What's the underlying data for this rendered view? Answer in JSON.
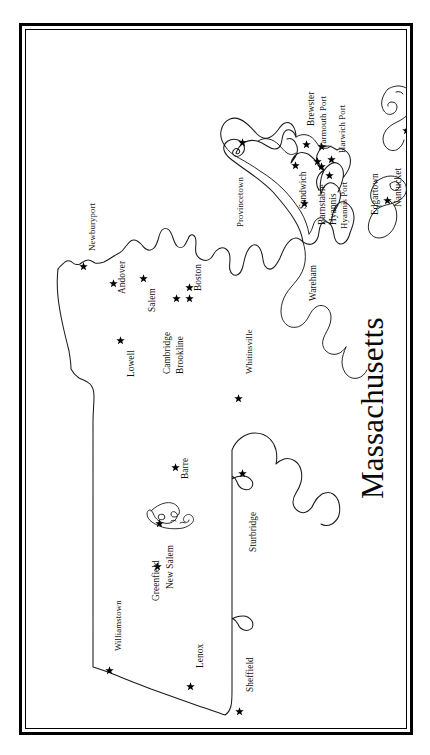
{
  "title": "Massachusetts",
  "frame": {
    "style": "double-line-border",
    "outer_color": "#000000",
    "inner_color": "#000000"
  },
  "map": {
    "orientation": "rotated-90-ccw",
    "state": "Massachusetts",
    "outline_color": "#1a1a1a",
    "background": "#ffffff",
    "marker_symbol": "star",
    "marker_color": "#000000",
    "features": [
      "mainland",
      "cape-cod",
      "marthas-vineyard",
      "nantucket",
      "quabbin-reservoir"
    ]
  },
  "cities": [
    {
      "name": "Newburyport",
      "label_x": 62,
      "label_y": 222,
      "star_x": 54,
      "star_y": 233
    },
    {
      "name": "Andover",
      "label_x": 92,
      "label_y": 265,
      "star_x": 84,
      "star_y": 250
    },
    {
      "name": "Salem",
      "label_x": 122,
      "label_y": 283,
      "star_x": 114,
      "star_y": 245
    },
    {
      "name": "Lowell",
      "label_x": 101,
      "label_y": 348,
      "star_x": 91,
      "star_y": 307
    },
    {
      "name": "Boston",
      "label_x": 168,
      "label_y": 262,
      "star_x": 160,
      "star_y": 254
    },
    {
      "name": "Cambridge",
      "label_x": 137,
      "label_y": 345,
      "star_x": 147,
      "star_y": 265
    },
    {
      "name": "Brookline",
      "label_x": 150,
      "label_y": 345,
      "star_x": 160,
      "star_y": 265
    },
    {
      "name": "Whitinsville",
      "label_x": 219,
      "label_y": 345,
      "star_x": 209,
      "star_y": 365
    },
    {
      "name": "Provincetown",
      "label_x": 210,
      "label_y": 198,
      "star_x": 213,
      "star_y": 109
    },
    {
      "name": "Sandwich",
      "label_x": 273,
      "label_y": 180,
      "star_x": 266,
      "star_y": 132
    },
    {
      "name": "Barnstable",
      "label_x": 292,
      "label_y": 196,
      "star_x": 288,
      "star_y": 128
    },
    {
      "name": "Hyannis",
      "label_x": 303,
      "label_y": 196,
      "star_x": 292,
      "star_y": 133
    },
    {
      "name": "Hyannis Port",
      "label_x": 314,
      "label_y": 200,
      "star_x": 300,
      "star_y": 142
    },
    {
      "name": "Brewster",
      "label_x": 281,
      "label_y": 97,
      "star_x": 277,
      "star_y": 111
    },
    {
      "name": "Yarmouth Port",
      "label_x": 293,
      "label_y": 120,
      "star_x": 292,
      "star_y": 113
    },
    {
      "name": "Harwich Port",
      "label_x": 312,
      "label_y": 124,
      "star_x": 302,
      "star_y": 126
    },
    {
      "name": "Wareham",
      "label_x": 283,
      "label_y": 272,
      "star_x": 275,
      "star_y": 170
    },
    {
      "name": "Edgartown",
      "label_x": 345,
      "label_y": 186,
      "star_x": 358,
      "star_y": 167
    },
    {
      "name": "Nantucket",
      "label_x": 368,
      "label_y": 178,
      "star_x": 377,
      "star_y": 97
    },
    {
      "name": "Williamstown",
      "label_x": 88,
      "label_y": 622,
      "star_x": 80,
      "star_y": 637
    },
    {
      "name": "Greenfield",
      "label_x": 126,
      "label_y": 572,
      "star_x": 128,
      "star_y": 533
    },
    {
      "name": "New Salem",
      "label_x": 140,
      "label_y": 560,
      "star_x": 130,
      "star_y": 490
    },
    {
      "name": "Barre",
      "label_x": 155,
      "label_y": 450,
      "star_x": 146,
      "star_y": 434
    },
    {
      "name": "Sturbridge",
      "label_x": 223,
      "label_y": 523,
      "star_x": 213,
      "star_y": 440
    },
    {
      "name": "Lenox",
      "label_x": 170,
      "label_y": 639,
      "star_x": 161,
      "star_y": 653
    },
    {
      "name": "Sheffield",
      "label_x": 220,
      "label_y": 663,
      "star_x": 210,
      "star_y": 678
    }
  ]
}
